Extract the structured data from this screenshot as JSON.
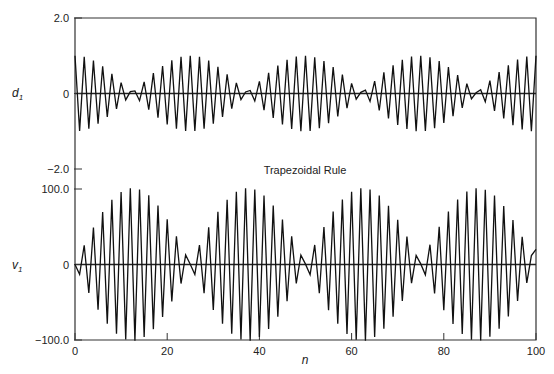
{
  "chart_data": [
    {
      "type": "line",
      "panel": "top",
      "ylabel": "d1",
      "ylabel_main": "d",
      "ylabel_sub": "1",
      "xlabel": "",
      "xlim": [
        0,
        100
      ],
      "ylim": [
        -2.0,
        2.0
      ],
      "yticks": [
        {
          "value": 2.0,
          "label": "2.0"
        },
        {
          "value": 0,
          "label": "0"
        },
        {
          "value": -2.0,
          "label": "−2.0"
        }
      ],
      "model": "d1(n) = (-1)^n * cos(pi*n/24.6)",
      "x": [
        0,
        1,
        2,
        3,
        4,
        5,
        6,
        7,
        8,
        9,
        10,
        11,
        12,
        13,
        14,
        15,
        16,
        17,
        18,
        19,
        20,
        21,
        22,
        23,
        24,
        25,
        26,
        27,
        28,
        29,
        30,
        31,
        32,
        33,
        34,
        35,
        36,
        37,
        38,
        39,
        40,
        41,
        42,
        43,
        44,
        45,
        46,
        47,
        48,
        49,
        50,
        51,
        52,
        53,
        54,
        55,
        56,
        57,
        58,
        59,
        60,
        61,
        62,
        63,
        64,
        65,
        66,
        67,
        68,
        69,
        70,
        71,
        72,
        73,
        74,
        75,
        76,
        77,
        78,
        79,
        80,
        81,
        82,
        83,
        84,
        85,
        86,
        87,
        88,
        89,
        90,
        91,
        92,
        93,
        94,
        95,
        96,
        97,
        98,
        99,
        100
      ],
      "values": [
        1.0,
        -0.99,
        0.97,
        -0.93,
        0.87,
        -0.8,
        0.72,
        -0.62,
        0.52,
        -0.41,
        0.29,
        -0.17,
        0.05,
        0.07,
        -0.19,
        0.31,
        -0.43,
        0.54,
        -0.64,
        0.73,
        -0.82,
        0.88,
        -0.93,
        0.97,
        -0.99,
        1.0,
        -0.99,
        0.97,
        -0.93,
        0.87,
        -0.8,
        0.71,
        -0.62,
        0.51,
        -0.4,
        0.28,
        -0.16,
        0.04,
        0.08,
        -0.2,
        0.32,
        -0.44,
        0.55,
        -0.65,
        0.74,
        -0.82,
        0.89,
        -0.94,
        0.98,
        -1.0,
        1.0,
        -0.99,
        0.96,
        -0.92,
        0.86,
        -0.79,
        0.7,
        -0.61,
        0.5,
        -0.39,
        0.27,
        -0.15,
        0.03,
        0.09,
        -0.21,
        0.33,
        -0.45,
        0.56,
        -0.66,
        0.75,
        -0.83,
        0.89,
        -0.94,
        0.98,
        -1.0,
        1.0,
        -0.99,
        0.96,
        -0.92,
        0.86,
        -0.78,
        0.7,
        -0.6,
        0.49,
        -0.38,
        0.26,
        -0.14,
        0.02,
        0.1,
        -0.22,
        0.34,
        -0.46,
        0.57,
        -0.66,
        0.75,
        -0.84,
        0.9,
        -0.95,
        0.98,
        -1.0,
        1.0
      ]
    },
    {
      "type": "line",
      "panel": "bottom",
      "title": "Trapezoidal Rule",
      "ylabel": "v1",
      "ylabel_main": "v",
      "ylabel_sub": "1",
      "xlabel": "n",
      "xlim": [
        0,
        100
      ],
      "ylim": [
        -100.0,
        100.0
      ],
      "xticks": [
        {
          "value": 0,
          "label": "0"
        },
        {
          "value": 20,
          "label": "20"
        },
        {
          "value": 40,
          "label": "40"
        },
        {
          "value": 60,
          "label": "60"
        },
        {
          "value": 80,
          "label": "80"
        },
        {
          "value": 100,
          "label": "100"
        }
      ],
      "yticks": [
        {
          "value": 100.0,
          "label": "100.0"
        },
        {
          "value": 0,
          "label": "0"
        },
        {
          "value": -100.0,
          "label": "−100.0"
        }
      ],
      "model": "v1(n) = 101 * (-1)^n * sin(pi*n/24.6)",
      "x": [
        0,
        1,
        2,
        3,
        4,
        5,
        6,
        7,
        8,
        9,
        10,
        11,
        12,
        13,
        14,
        15,
        16,
        17,
        18,
        19,
        20,
        21,
        22,
        23,
        24,
        25,
        26,
        27,
        28,
        29,
        30,
        31,
        32,
        33,
        34,
        35,
        36,
        37,
        38,
        39,
        40,
        41,
        42,
        43,
        44,
        45,
        46,
        47,
        48,
        49,
        50,
        51,
        52,
        53,
        54,
        55,
        56,
        57,
        58,
        59,
        60,
        61,
        62,
        63,
        64,
        65,
        66,
        67,
        68,
        69,
        70,
        71,
        72,
        73,
        74,
        75,
        76,
        77,
        78,
        79,
        80,
        81,
        82,
        83,
        84,
        85,
        86,
        87,
        88,
        89,
        90,
        91,
        92,
        93,
        94,
        95,
        96,
        97,
        98,
        99,
        100
      ],
      "values": [
        0,
        -12.9,
        25.4,
        -37.6,
        49.1,
        -59.9,
        69.6,
        -78.3,
        85.6,
        -91.7,
        96.1,
        -99.3,
        100.9,
        -100.9,
        99.3,
        -96.1,
        91.6,
        -85.6,
        78.2,
        -69.5,
        59.8,
        -48.9,
        37.4,
        -25.2,
        12.7,
        0.3,
        -13.2,
        25.7,
        -37.9,
        49.3,
        -60.1,
        69.9,
        -78.5,
        85.8,
        -91.8,
        96.3,
        -99.4,
        100.9,
        -100.9,
        99.2,
        -96,
        91.4,
        -85.4,
        78,
        -69.3,
        59.5,
        -48.7,
        37.2,
        -25,
        12.4,
        0.5,
        -13.5,
        25.9,
        -38.1,
        49.6,
        -60.4,
        70.1,
        -78.6,
        86,
        -91.9,
        96.4,
        -99.5,
        100.9,
        -100.9,
        99.2,
        -95.9,
        91.3,
        -85.2,
        77.8,
        -69,
        59.3,
        -48.4,
        36.9,
        -24.7,
        12.1,
        0.8,
        -13.7,
        26.2,
        -38.4,
        49.8,
        -60.6,
        70.3,
        -78.8,
        86.1,
        -92,
        96.5,
        -99.5,
        100.9,
        -100.8,
        99.1,
        -95.8,
        91.2,
        -85.1,
        77.6,
        -68.8,
        59,
        -48.2,
        36.7,
        -24.4,
        11.8,
        20.1
      ]
    }
  ],
  "labels": {
    "title": "Trapezoidal Rule",
    "xlabel": "n"
  }
}
